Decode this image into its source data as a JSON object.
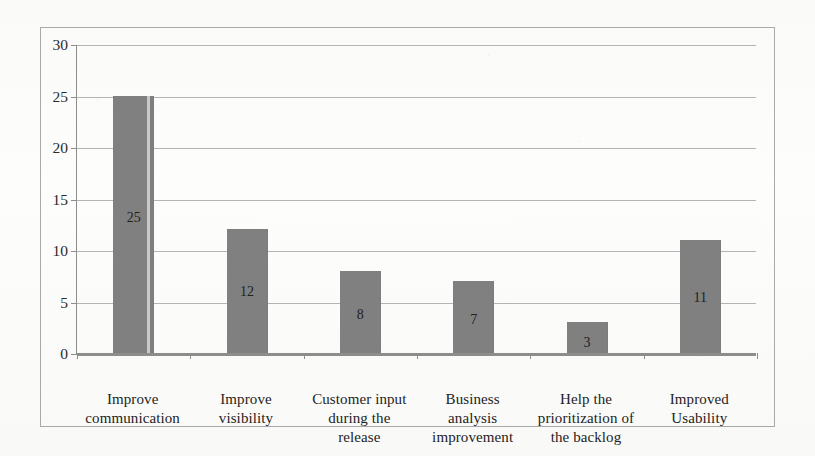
{
  "figure": {
    "background_color": "#fbfbfa",
    "frame_color": "#a9a9a9",
    "axis_color": "#8d8d8d",
    "gridline_color": "#b4b4b4",
    "bar_color": "#808080",
    "text_color": "#232323"
  },
  "chart_data": {
    "type": "bar",
    "title": "",
    "subtitle": "",
    "xlabel": "",
    "ylabel": "",
    "categories": [
      "Improve communication",
      "Improve visibility",
      "Customer input during the release",
      "Business analysis improvement",
      "Help the prioritization of the backlog",
      "Improved Usability"
    ],
    "values": [
      25,
      12,
      8,
      7,
      3,
      11
    ],
    "data_labels": [
      "25",
      "12",
      "8",
      "7",
      "3",
      "11"
    ],
    "ylim": [
      0,
      30
    ],
    "ytick_values": [
      0,
      5,
      10,
      15,
      20,
      25,
      30
    ],
    "ytick_labels": [
      "0",
      "5",
      "10",
      "15",
      "20",
      "25",
      "30"
    ],
    "grid": true,
    "grid_axis": "y",
    "legend": false,
    "legend_position": "none",
    "bar_color": "#808080",
    "orientation": "vertical"
  },
  "category_lines": [
    [
      "Improve",
      "communication"
    ],
    [
      "Improve",
      "visibility"
    ],
    [
      "Customer input",
      "during the",
      "release"
    ],
    [
      "Business",
      "analysis",
      "improvement"
    ],
    [
      "Help the",
      "prioritization of",
      "the backlog"
    ],
    [
      "Improved",
      "Usability"
    ]
  ]
}
